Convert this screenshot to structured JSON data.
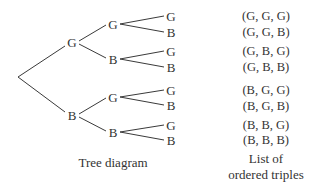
{
  "tree": {
    "level1": [
      {
        "label": "G"
      },
      {
        "label": "B"
      }
    ],
    "level2": [
      {
        "label": "G"
      },
      {
        "label": "B"
      },
      {
        "label": "G"
      },
      {
        "label": "B"
      }
    ],
    "level3": [
      {
        "label": "G"
      },
      {
        "label": "B"
      },
      {
        "label": "G"
      },
      {
        "label": "B"
      },
      {
        "label": "G"
      },
      {
        "label": "B"
      },
      {
        "label": "G"
      },
      {
        "label": "B"
      }
    ],
    "caption": "Tree diagram"
  },
  "triples": {
    "items": [
      "(G, G, G)",
      "(G, G, B)",
      "(G, B, G)",
      "(G, B, B)",
      "(B, G, G)",
      "(B, G, B)",
      "(B, B, G)",
      "(B, B, B)"
    ],
    "caption_line1": "List of",
    "caption_line2": "ordered triples"
  },
  "colors": {
    "line": "#3a3a3a",
    "text": "#333333"
  }
}
